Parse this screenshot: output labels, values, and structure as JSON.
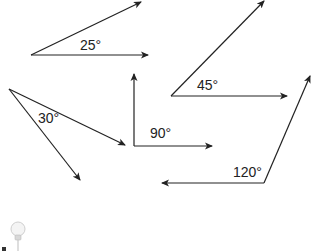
{
  "diagram": {
    "title": "",
    "line_color": "#222222",
    "angles": [
      {
        "id": "angle-25",
        "label": "25°",
        "degrees": 25,
        "vertex": [
          31,
          55
        ],
        "ray1_end": [
          141,
          2
        ],
        "ray2_end": [
          148,
          55
        ],
        "label_pos": [
          80,
          50
        ]
      },
      {
        "id": "angle-45",
        "label": "45°",
        "degrees": 45,
        "vertex": [
          171,
          96
        ],
        "ray1_end": [
          264,
          1
        ],
        "ray2_end": [
          287,
          96
        ],
        "label_pos": [
          197,
          90
        ]
      },
      {
        "id": "angle-30",
        "label": "30°",
        "degrees": 30,
        "vertex": [
          9,
          89
        ],
        "ray1_end": [
          125,
          145
        ],
        "ray2_end": [
          80,
          180
        ],
        "label_pos": [
          38,
          123
        ]
      },
      {
        "id": "angle-90",
        "label": "90°",
        "degrees": 90,
        "vertex": [
          134,
          146
        ],
        "ray1_end": [
          134,
          74
        ],
        "ray2_end": [
          212,
          146
        ],
        "label_pos": [
          150,
          138
        ]
      },
      {
        "id": "angle-120",
        "label": "120°",
        "degrees": 120,
        "vertex": [
          264,
          183
        ],
        "ray1_end": [
          310,
          76
        ],
        "ray2_end": [
          162,
          183
        ],
        "label_pos": [
          233,
          177
        ]
      }
    ],
    "icon": {
      "name": "lightbulb-icon"
    }
  }
}
